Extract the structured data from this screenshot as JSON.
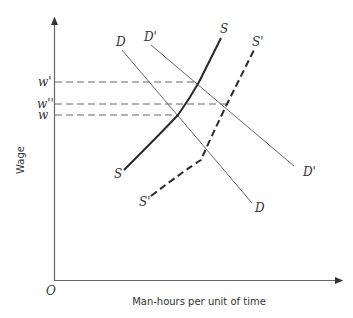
{
  "diagram": {
    "type": "labor-market supply-demand",
    "axes": {
      "origin_label": "O",
      "y_label": "Wage",
      "x_label": "Man-hours per unit of time"
    },
    "wage_levels": [
      {
        "label": "w'",
        "y": 82
      },
      {
        "label": "w''",
        "y": 104
      },
      {
        "label": "w",
        "y": 115
      }
    ],
    "curves": {
      "S": {
        "top_label": "S",
        "bottom_label": "S",
        "style": "solid-thick"
      },
      "S_prime": {
        "top_label": "S'",
        "bottom_label": "S'",
        "style": "dashed-thick"
      },
      "D": {
        "top_label": "D",
        "bottom_label": "D",
        "style": "solid-thin"
      },
      "D_prime": {
        "top_label": "D'",
        "bottom_label": "D'",
        "style": "solid-thin"
      }
    },
    "colors": {
      "line": "#555555",
      "thick_line": "#2a2a2a",
      "dashed_guide": "#666666"
    }
  }
}
